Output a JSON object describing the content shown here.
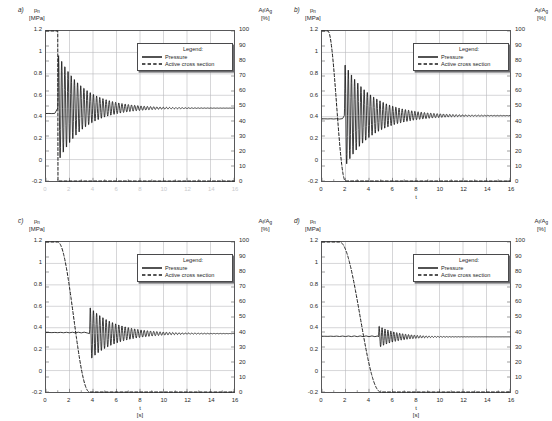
{
  "figure": {
    "axis_titles": {
      "y_left_symbol": "p",
      "y_left_subscript": "n",
      "y_left_unit": "[MPa]",
      "y_right_symbol_a": "A",
      "y_right_subscript_a": "f",
      "y_right_symbol_b": "A",
      "y_right_subscript_b": "g",
      "y_right_slash": "/",
      "y_right_unit": "[%]",
      "x_symbol": "t",
      "x_unit": "[s]"
    },
    "legend": {
      "title": "Legend:",
      "pressure_label": "Pressure",
      "active_label": "Active cross section"
    },
    "colors": {
      "curve": "#1a1a1a",
      "grid": "#b9b9bd",
      "frame": "#58585a",
      "background": "#ffffff"
    },
    "ticks": {
      "y_left": [
        "1.2",
        "1",
        "0.8",
        "0.6",
        "0.4",
        "0.2",
        "0",
        "-0.2"
      ],
      "y_right": [
        "100",
        "90",
        "80",
        "70",
        "60",
        "50",
        "40",
        "30",
        "20",
        "10",
        "0"
      ],
      "x": [
        "0",
        "2",
        "4",
        "6",
        "8",
        "10",
        "12",
        "14",
        "16"
      ]
    },
    "panels": [
      {
        "label": "a)",
        "has_xticks": false,
        "has_xtitle": false
      },
      {
        "label": "b)",
        "has_xticks": true,
        "has_xtitle": false
      },
      {
        "label": "c)",
        "has_xticks": true,
        "has_xtitle": true
      },
      {
        "label": "d)",
        "has_xticks": true,
        "has_xtitle": true
      }
    ]
  },
  "chart_data": {
    "type": "line",
    "title": "",
    "xlabel": "t [s]",
    "ylabel": "p_n [MPa]",
    "ylabel_secondary": "A_f/A_g [%]",
    "xlim": [
      0,
      16
    ],
    "ylim": [
      -0.2,
      1.2
    ],
    "ylim_secondary": [
      0,
      100
    ],
    "grid": true,
    "legend_position": "upper-right-inside",
    "panel_count": 4,
    "panels": [
      {
        "label": "a)",
        "description": "Instantaneous closure of active cross section at t = 1 s; strongest pressure surge.",
        "series": [
          {
            "name": "Pressure",
            "style": "solid",
            "axis": "left",
            "unit": "MPa",
            "initial_value": 0.43,
            "steady_value": 0.48,
            "peak_value": 1.0,
            "min_value": -0.04,
            "oscillation_start_t": 1.0,
            "oscillation_period_s": 0.27,
            "damping_time_constant_s": 2.2,
            "x": [
              0,
              0.5,
              0.95,
              1.0,
              1.05,
              1.14,
              1.27,
              1.41,
              1.55,
              1.68,
              1.82,
              1.95,
              2.1,
              2.4,
              2.8,
              3.3,
              4.0,
              5.0,
              6.5,
              8.0,
              10.0,
              12.0,
              14.0
            ],
            "y": [
              0.43,
              0.43,
              0.43,
              1.0,
              0.44,
              -0.04,
              0.87,
              0.02,
              0.81,
              0.08,
              0.76,
              0.13,
              0.71,
              0.66,
              0.62,
              0.58,
              0.54,
              0.51,
              0.49,
              0.485,
              0.48,
              0.48,
              0.48
            ]
          },
          {
            "name": "Active cross section",
            "style": "dashed",
            "axis": "right",
            "unit": "%",
            "initial_value": 100,
            "final_value": 0,
            "drop_start_t": 1.0,
            "drop_end_t": 1.02,
            "x": [
              0,
              1.0,
              1.02,
              14.0
            ],
            "y": [
              100,
              100,
              0,
              0
            ]
          }
        ]
      },
      {
        "label": "b)",
        "description": "Fast closure of active cross section between t = 0.5 s and t = 2 s; large pressure surge.",
        "series": [
          {
            "name": "Pressure",
            "style": "solid",
            "axis": "left",
            "unit": "MPa",
            "initial_value": 0.38,
            "steady_value": 0.41,
            "peak_value": 0.91,
            "min_value": -0.06,
            "oscillation_start_t": 1.9,
            "oscillation_period_s": 0.27,
            "damping_time_constant_s": 2.4,
            "x": [
              0,
              1.0,
              1.7,
              1.9,
              2.0,
              2.1,
              2.2,
              2.35,
              2.5,
              2.7,
              2.9,
              3.2,
              3.6,
              4.2,
              5.0,
              6.0,
              7.5,
              9.0,
              11.0,
              13.0,
              14.0
            ],
            "y": [
              0.38,
              0.38,
              0.38,
              0.3,
              -0.06,
              0.91,
              0.05,
              0.8,
              0.12,
              0.73,
              0.18,
              0.66,
              0.6,
              0.55,
              0.5,
              0.46,
              0.43,
              0.42,
              0.41,
              0.41,
              0.41
            ]
          },
          {
            "name": "Active cross section",
            "style": "dashed",
            "axis": "right",
            "unit": "%",
            "initial_value": 100,
            "final_value": 0,
            "drop_start_t": 0.5,
            "drop_end_t": 2.0,
            "x": [
              0,
              0.4,
              0.7,
              1.0,
              1.25,
              1.5,
              1.7,
              1.85,
              1.95,
              2.0,
              14.0
            ],
            "y": [
              100,
              100,
              96,
              85,
              68,
              46,
              26,
              12,
              4,
              0,
              0
            ]
          }
        ]
      },
      {
        "label": "c)",
        "description": "Medium-speed closure between t = 1 s and t = 3.7 s; moderate pressure surge.",
        "series": [
          {
            "name": "Pressure",
            "style": "solid",
            "axis": "left",
            "unit": "MPa",
            "initial_value": 0.355,
            "steady_value": 0.345,
            "peak_value": 0.6,
            "min_value": 0.15,
            "oscillation_start_t": 3.7,
            "oscillation_period_s": 0.27,
            "damping_time_constant_s": 2.2,
            "x": [
              0,
              1.5,
              3.0,
              3.6,
              3.75,
              3.85,
              4.0,
              4.15,
              4.3,
              4.5,
              4.7,
              5.0,
              5.4,
              6.0,
              7.0,
              8.5,
              10.0,
              12.0,
              14.0
            ],
            "y": [
              0.355,
              0.355,
              0.355,
              0.34,
              0.6,
              0.16,
              0.55,
              0.2,
              0.51,
              0.24,
              0.47,
              0.43,
              0.4,
              0.375,
              0.36,
              0.35,
              0.345,
              0.345,
              0.345
            ]
          },
          {
            "name": "Active cross section",
            "style": "dashed",
            "axis": "right",
            "unit": "%",
            "initial_value": 100,
            "final_value": 0,
            "drop_start_t": 1.0,
            "drop_end_t": 3.7,
            "x": [
              0,
              0.8,
              1.2,
              1.6,
              2.0,
              2.4,
              2.8,
              3.1,
              3.4,
              3.6,
              3.7,
              14.0
            ],
            "y": [
              100,
              100,
              96,
              88,
              76,
              62,
              46,
              32,
              17,
              6,
              0,
              0
            ]
          }
        ]
      },
      {
        "label": "d)",
        "description": "Slow closure between t = 1.5 s and t = 5 s; smallest pressure surge.",
        "series": [
          {
            "name": "Pressure",
            "style": "solid",
            "axis": "left",
            "unit": "MPa",
            "initial_value": 0.32,
            "steady_value": 0.315,
            "peak_value": 0.42,
            "min_value": 0.25,
            "oscillation_start_t": 4.8,
            "oscillation_period_s": 0.25,
            "damping_time_constant_s": 1.6,
            "x": [
              0,
              2.0,
              4.0,
              4.7,
              4.9,
              5.05,
              5.2,
              5.35,
              5.5,
              5.7,
              5.9,
              6.2,
              6.6,
              7.2,
              8.0,
              9.5,
              11.0,
              13.0,
              14.0
            ],
            "y": [
              0.32,
              0.32,
              0.32,
              0.345,
              0.42,
              0.26,
              0.4,
              0.27,
              0.385,
              0.285,
              0.37,
              0.295,
              0.355,
              0.33,
              0.322,
              0.317,
              0.315,
              0.315,
              0.315
            ]
          },
          {
            "name": "Active cross section",
            "style": "dashed",
            "axis": "right",
            "unit": "%",
            "initial_value": 100,
            "final_value": 0,
            "drop_start_t": 1.5,
            "drop_end_t": 5.0,
            "x": [
              0,
              1.2,
              1.8,
              2.3,
              2.8,
              3.2,
              3.6,
              4.0,
              4.3,
              4.6,
              4.85,
              5.0,
              14.0
            ],
            "y": [
              100,
              100,
              96,
              89,
              78,
              68,
              55,
              40,
              27,
              14,
              4,
              0,
              0
            ]
          }
        ]
      }
    ]
  }
}
